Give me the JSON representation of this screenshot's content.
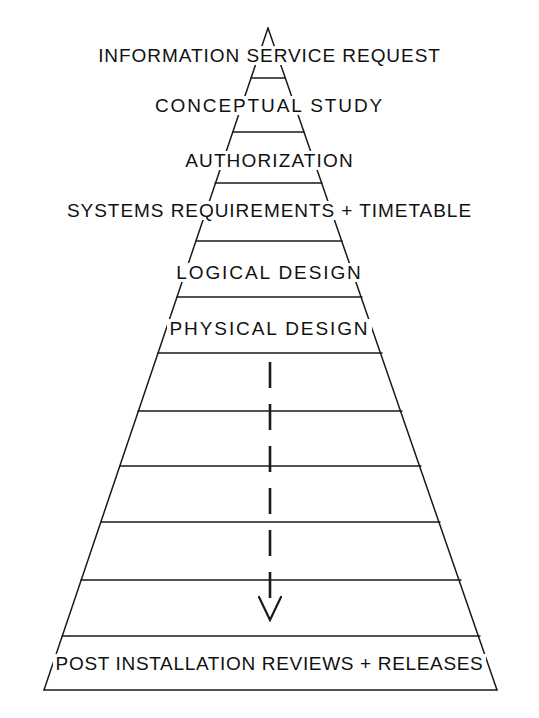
{
  "diagram": {
    "shape": "triangle",
    "stroke_color": "#1a1a1a",
    "background_color": "#ffffff",
    "apex": {
      "x": 268,
      "y": 28
    },
    "base_left": {
      "x": 44,
      "y": 690
    },
    "base_right": {
      "x": 497,
      "y": 690
    },
    "stages": [
      {
        "label": "INFORMATION SERVICE REQUEST",
        "y": 57,
        "font_size": 19,
        "letter_spacing": "0.05em"
      },
      {
        "label": "CONCEPTUAL STUDY",
        "y": 107,
        "font_size": 19,
        "letter_spacing": "0.10em"
      },
      {
        "label": "AUTHORIZATION",
        "y": 162,
        "font_size": 19,
        "letter_spacing": "0.06em"
      },
      {
        "label": "SYSTEMS REQUIREMENTS + TIMETABLE",
        "y": 212,
        "font_size": 19,
        "letter_spacing": "0.05em"
      },
      {
        "label": "LOGICAL DESIGN",
        "y": 274,
        "font_size": 19,
        "letter_spacing": "0.10em"
      },
      {
        "label": "PHYSICAL DESIGN",
        "y": 330,
        "font_size": 19,
        "letter_spacing": "0.10em"
      },
      {
        "label": "POST INSTALLATION REVIEWS + RELEASES",
        "y": 665,
        "font_size": 19,
        "letter_spacing": "0.035em"
      }
    ],
    "divider_lines_y": [
      78,
      132,
      183,
      241,
      297,
      353,
      411,
      466,
      522,
      580,
      636
    ],
    "arrow": {
      "name": "downward-flow-arrow",
      "style": "dashed",
      "x": 270,
      "y_start": 362,
      "y_end": 618,
      "head_width": 20,
      "head_height": 22
    }
  }
}
